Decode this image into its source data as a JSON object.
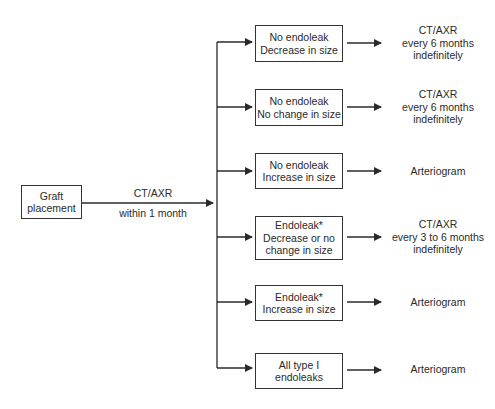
{
  "start": {
    "lines": [
      "Graft",
      "placement"
    ]
  },
  "main_edge": {
    "label_top": "CT/AXR",
    "label_bottom": "within 1 month"
  },
  "branches": [
    {
      "condition": [
        "No endoleak",
        "Decrease in size"
      ],
      "action": [
        "CT/AXR",
        "every 6 months",
        "indefinitely"
      ]
    },
    {
      "condition": [
        "No endoleak",
        "No change in size"
      ],
      "action": [
        "CT/AXR",
        "every 6 months",
        "indefinitely"
      ]
    },
    {
      "condition": [
        "No endoleak",
        "Increase in size"
      ],
      "action": [
        "Arteriogram"
      ]
    },
    {
      "condition": [
        "Endoleak*",
        "Decrease or no",
        "change in size"
      ],
      "action": [
        "CT/AXR",
        "every 3 to 6 months",
        "indefinitely"
      ]
    },
    {
      "condition": [
        "Endoleak*",
        "Increase in size"
      ],
      "action": [
        "Arteriogram"
      ]
    },
    {
      "condition": [
        "All type I",
        "endoleaks"
      ],
      "action": [
        "Arteriogram"
      ]
    }
  ],
  "colors": {
    "line": "#2a2a2a",
    "text": "#2a2a2a",
    "background": "#ffffff"
  }
}
